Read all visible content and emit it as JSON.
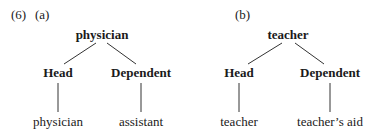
{
  "example_number": "(6)",
  "trees": [
    {
      "label": "(a)",
      "root": "physician",
      "head_label": "Head",
      "dependent_label": "Dependent",
      "head_leaf": "physician",
      "dependent_leaf": "assistant"
    },
    {
      "label": "(b)",
      "root": "teacher",
      "head_label": "Head",
      "dependent_label": "Dependent",
      "head_leaf": "teacher",
      "dependent_leaf": "teacher’s aid"
    }
  ],
  "colors": {
    "text": "#1a1a1a",
    "line": "#333333",
    "background": "#ffffff"
  }
}
